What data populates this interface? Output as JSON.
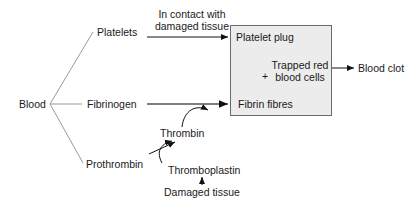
{
  "diagram": {
    "root": "Blood",
    "branches": {
      "platelets": "Platelets",
      "fibrinogen": "Fibrinogen",
      "prothrombin": "Prothrombin"
    },
    "contact_note": [
      "In contact with",
      "damaged tissue"
    ],
    "box": {
      "platelet_plug": "Platelet plug",
      "plus": "+",
      "trapped": [
        "Trapped red",
        "blood cells"
      ],
      "fibrin": "Fibrin fibres",
      "fill": "#ececec"
    },
    "thrombin": "Thrombin",
    "thromboplastin": "Thromboplastin",
    "damaged_tissue": "Damaged tissue",
    "result": "Blood clot"
  }
}
